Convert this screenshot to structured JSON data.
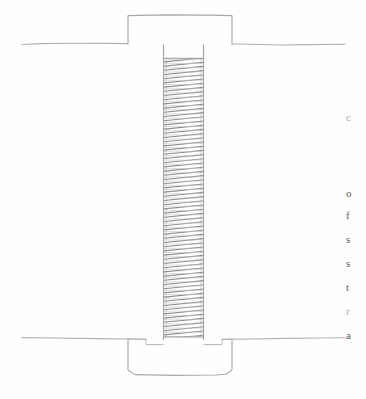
{
  "document": {
    "kind": "scanned-page-figure",
    "page_background": "#fefefe",
    "width": 366,
    "height": 399
  },
  "figure": {
    "ink_color": "#9a9a9a",
    "thread_color": "#8e8e8e",
    "outline_color": "#a6a6a6",
    "parts": [
      {
        "name": "bolt-head",
        "label": "head"
      },
      {
        "name": "threaded-shank",
        "label": "threaded shank"
      },
      {
        "name": "upper-plate-line",
        "label": "upper plate surface"
      },
      {
        "name": "lower-plate-line",
        "label": "lower plate surface"
      },
      {
        "name": "nut-body",
        "label": "nut body"
      },
      {
        "name": "seat-notch-left",
        "label": "left seat notch"
      },
      {
        "name": "seat-notch-right",
        "label": "right seat notch"
      }
    ],
    "geometry": {
      "head_top_y": 15,
      "head_left_x": 128,
      "head_right_x": 232,
      "head_bottom_y": 45,
      "shank_left_x": 163,
      "shank_right_x": 204,
      "thread_top_y": 58,
      "thread_bottom_y": 337,
      "thread_pitch_px": 4.2,
      "thread_count": 67,
      "upper_line_y": 44,
      "lower_line_y": 338,
      "line_left_x": 22,
      "line_right_x": 345,
      "nut_bottom_y": 375
    }
  },
  "margin_text": {
    "note": "cropped right-hand column text fragments bleeding in from the adjacent page column",
    "fragments": [
      {
        "text": "c",
        "top": 0,
        "faint": true
      },
      {
        "text": "o",
        "top": 76,
        "faint": false
      },
      {
        "text": "f",
        "top": 98,
        "faint": false
      },
      {
        "text": "s",
        "top": 122,
        "faint": false
      },
      {
        "text": "s",
        "top": 146,
        "faint": false
      },
      {
        "text": "t",
        "top": 170,
        "faint": false
      },
      {
        "text": "r",
        "top": 194,
        "faint": true
      },
      {
        "text": "a",
        "top": 218,
        "faint": false
      }
    ]
  }
}
